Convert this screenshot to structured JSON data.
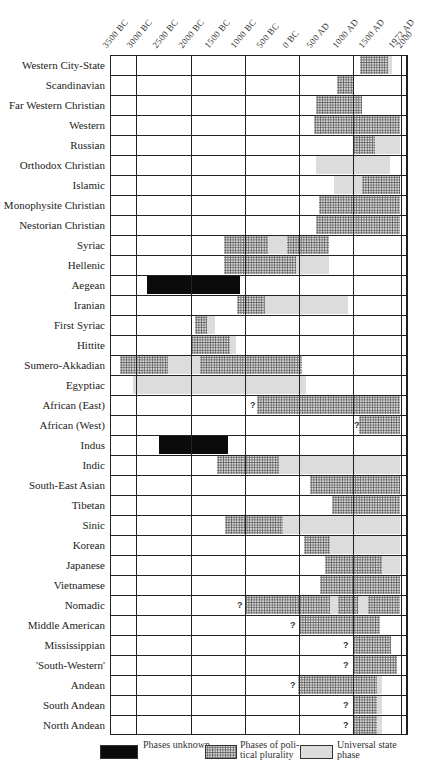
{
  "chart_data": {
    "type": "timeline",
    "title": "",
    "xlabel": "",
    "ylabel": "",
    "x_ticks": [
      "3500 BC",
      "3000 BC",
      "2500 BC",
      "2000 BC",
      "1500 BC",
      "1000 BC",
      "500 BC",
      "0 BC",
      "500 AD",
      "1000 AD",
      "1500 AD",
      "1972 AD",
      "2000"
    ],
    "x_tick_px": [
      110,
      134,
      160,
      186,
      212,
      238,
      264,
      290,
      314,
      340,
      366,
      396,
      404
    ],
    "gridlines_px": [
      110,
      136,
      191,
      245,
      299,
      353,
      401,
      407
    ],
    "phase_types": {
      "black": "Phases unknown",
      "stipple": "Phases of political plurality",
      "grey": "Universal state phase"
    },
    "legend": [
      {
        "key": "black",
        "label": "Phases unknown"
      },
      {
        "key": "stipple",
        "label": "Phases of political plurality"
      },
      {
        "key": "grey",
        "label": "Universal state phase"
      }
    ],
    "rows": [
      {
        "name": "Western City-State",
        "segments": [
          {
            "type": "stipple",
            "x0": 360,
            "x1": 388
          },
          {
            "type": "grey",
            "x0": 388,
            "x1": 392
          }
        ]
      },
      {
        "name": "Scandinavian",
        "segments": [
          {
            "type": "stipple",
            "x0": 337,
            "x1": 353
          }
        ]
      },
      {
        "name": "Far Western Christian",
        "segments": [
          {
            "type": "stipple",
            "x0": 316,
            "x1": 362
          }
        ]
      },
      {
        "name": "Western",
        "segments": [
          {
            "type": "stipple",
            "x0": 314,
            "x1": 400
          }
        ]
      },
      {
        "name": "Russian",
        "segments": [
          {
            "type": "stipple",
            "x0": 353,
            "x1": 375
          },
          {
            "type": "grey",
            "x0": 375,
            "x1": 400
          }
        ]
      },
      {
        "name": "Orthodox Christian",
        "segments": [
          {
            "type": "grey",
            "x0": 316,
            "x1": 390
          }
        ]
      },
      {
        "name": "Islamic",
        "segments": [
          {
            "type": "grey",
            "x0": 334,
            "x1": 362
          },
          {
            "type": "stipple",
            "x0": 362,
            "x1": 400
          }
        ]
      },
      {
        "name": "Monophysite Christian",
        "segments": [
          {
            "type": "stipple",
            "x0": 319,
            "x1": 400
          }
        ]
      },
      {
        "name": "Nestorian Christian",
        "segments": [
          {
            "type": "stipple",
            "x0": 316,
            "x1": 400
          }
        ]
      },
      {
        "name": "Syriac",
        "segments": [
          {
            "type": "stipple",
            "x0": 224,
            "x1": 268
          },
          {
            "type": "grey",
            "x0": 268,
            "x1": 287
          },
          {
            "type": "stipple",
            "x0": 287,
            "x1": 329
          }
        ]
      },
      {
        "name": "Hellenic",
        "segments": [
          {
            "type": "stipple",
            "x0": 224,
            "x1": 296
          },
          {
            "type": "grey",
            "x0": 296,
            "x1": 329
          }
        ]
      },
      {
        "name": "Aegean",
        "segments": [
          {
            "type": "black",
            "x0": 147,
            "x1": 240
          }
        ]
      },
      {
        "name": "Iranian",
        "segments": [
          {
            "type": "stipple",
            "x0": 237,
            "x1": 265
          },
          {
            "type": "grey",
            "x0": 265,
            "x1": 348
          }
        ]
      },
      {
        "name": "First Syriac",
        "segments": [
          {
            "type": "stipple",
            "x0": 195,
            "x1": 207
          },
          {
            "type": "grey",
            "x0": 207,
            "x1": 215
          }
        ]
      },
      {
        "name": "Hittite",
        "segments": [
          {
            "type": "stipple",
            "x0": 191,
            "x1": 230
          },
          {
            "type": "grey",
            "x0": 230,
            "x1": 236
          }
        ]
      },
      {
        "name": "Sumero-Akkadian",
        "segments": [
          {
            "type": "stipple",
            "x0": 120,
            "x1": 168
          },
          {
            "type": "grey",
            "x0": 168,
            "x1": 200
          },
          {
            "type": "stipple",
            "x0": 200,
            "x1": 302
          }
        ]
      },
      {
        "name": "Egyptiac",
        "segments": [
          {
            "type": "grey",
            "x0": 133,
            "x1": 306
          }
        ]
      },
      {
        "name": "African (East)",
        "question_px": 250,
        "segments": [
          {
            "type": "stipple",
            "x0": 257,
            "x1": 400
          }
        ]
      },
      {
        "name": "African (West)",
        "question_px": 354,
        "segments": [
          {
            "type": "stipple",
            "x0": 359,
            "x1": 400
          }
        ]
      },
      {
        "name": "Indus",
        "segments": [
          {
            "type": "black",
            "x0": 159,
            "x1": 228
          }
        ]
      },
      {
        "name": "Indic",
        "segments": [
          {
            "type": "stipple",
            "x0": 217,
            "x1": 279
          },
          {
            "type": "grey",
            "x0": 279,
            "x1": 400
          }
        ]
      },
      {
        "name": "South-East Asian",
        "segments": [
          {
            "type": "stipple",
            "x0": 310,
            "x1": 400
          }
        ]
      },
      {
        "name": "Tibetan",
        "segments": [
          {
            "type": "stipple",
            "x0": 332,
            "x1": 400
          }
        ]
      },
      {
        "name": "Sinic",
        "segments": [
          {
            "type": "stipple",
            "x0": 225,
            "x1": 283
          },
          {
            "type": "grey",
            "x0": 283,
            "x1": 400
          }
        ]
      },
      {
        "name": "Korean",
        "segments": [
          {
            "type": "stipple",
            "x0": 304,
            "x1": 330
          },
          {
            "type": "grey",
            "x0": 330,
            "x1": 400
          }
        ]
      },
      {
        "name": "Japanese",
        "segments": [
          {
            "type": "stipple",
            "x0": 325,
            "x1": 382
          },
          {
            "type": "grey",
            "x0": 382,
            "x1": 400
          }
        ]
      },
      {
        "name": "Vietnamese",
        "segments": [
          {
            "type": "stipple",
            "x0": 320,
            "x1": 400
          }
        ]
      },
      {
        "name": "Nomadic",
        "question_px": 237,
        "segments": [
          {
            "type": "stipple",
            "x0": 245,
            "x1": 330
          },
          {
            "type": "grey",
            "x0": 330,
            "x1": 338
          },
          {
            "type": "stipple",
            "x0": 338,
            "x1": 358
          },
          {
            "type": "grey",
            "x0": 358,
            "x1": 368
          },
          {
            "type": "stipple",
            "x0": 368,
            "x1": 400
          }
        ]
      },
      {
        "name": "Middle American",
        "question_px": 290,
        "segments": [
          {
            "type": "stipple",
            "x0": 299,
            "x1": 380
          }
        ]
      },
      {
        "name": "Mississippian",
        "question_px": 343,
        "segments": [
          {
            "type": "stipple",
            "x0": 353,
            "x1": 391
          }
        ]
      },
      {
        "name": "'South-Western'",
        "question_px": 343,
        "segments": [
          {
            "type": "stipple",
            "x0": 353,
            "x1": 397
          }
        ]
      },
      {
        "name": "Andean",
        "question_px": 290,
        "segments": [
          {
            "type": "stipple",
            "x0": 298,
            "x1": 377
          },
          {
            "type": "grey",
            "x0": 377,
            "x1": 382
          }
        ]
      },
      {
        "name": "South Andean",
        "question_px": 343,
        "segments": [
          {
            "type": "stipple",
            "x0": 353,
            "x1": 377
          },
          {
            "type": "grey",
            "x0": 377,
            "x1": 382
          }
        ]
      },
      {
        "name": "North Andean",
        "question_px": 343,
        "segments": [
          {
            "type": "stipple",
            "x0": 353,
            "x1": 377
          },
          {
            "type": "grey",
            "x0": 377,
            "x1": 382
          }
        ]
      }
    ]
  },
  "legend_labels": {
    "black": "Phases unknown",
    "stipple": "Phases of poli-tical plurality",
    "grey": "Universal state phase"
  },
  "question_mark": "?"
}
